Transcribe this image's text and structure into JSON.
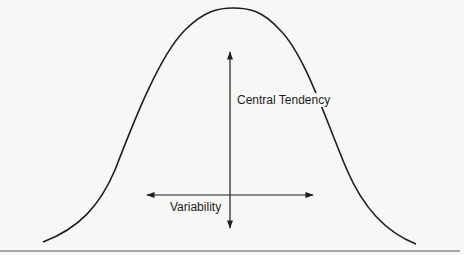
{
  "diagram": {
    "type": "normal-distribution-curve",
    "labels": {
      "vertical_axis": "Central Tendency",
      "horizontal_axis": "Variability"
    },
    "colors": {
      "background": "#f7f7f5",
      "stroke": "#1e1e1e",
      "rule": "#555555"
    }
  }
}
